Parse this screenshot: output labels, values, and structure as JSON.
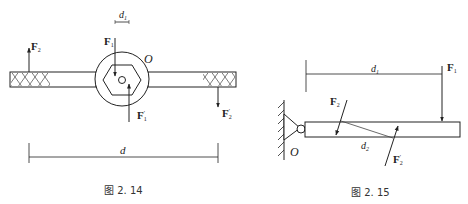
{
  "figures": [
    {
      "caption": "图 2. 14",
      "labels": {
        "F1": "F",
        "F1_sub": "1",
        "F1p": "F",
        "F1p_sub": "1",
        "F1p_sup": "′",
        "F2": "F",
        "F2_sub": "2",
        "F2p": "F",
        "F2p_sub": "2",
        "F2p_sup": "′",
        "O": "O",
        "d1": "d",
        "d1_sub": "1",
        "d": "d"
      }
    },
    {
      "caption": "图 2. 15",
      "labels": {
        "F1": "F",
        "F1_sub": "1",
        "F2": "F",
        "F2_sub": "2",
        "F2p": "F",
        "F2p_sub": "2",
        "F2p_sup": "′",
        "O": "O",
        "d1": "d",
        "d1_sub": "1",
        "d2": "d",
        "d2_sub": "2"
      }
    }
  ]
}
